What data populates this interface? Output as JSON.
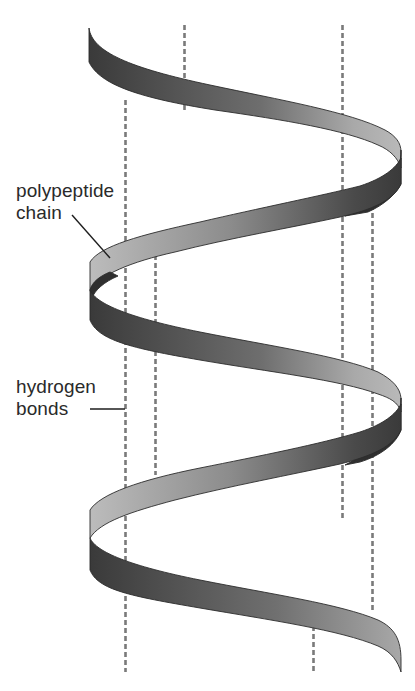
{
  "diagram": {
    "labels": {
      "polypeptide": {
        "line1": "polypeptide",
        "line2": "chain"
      },
      "hydrogen": {
        "line1": "hydrogen",
        "line2": "bonds"
      }
    },
    "colors": {
      "background": "#ffffff",
      "ribbon_dark": "#3a3a3a",
      "ribbon_mid": "#8a8a8a",
      "ribbon_light": "#bdbdbd",
      "dashed_line": "#7a7a7a",
      "text": "#2a2a2a"
    },
    "elements": {
      "ribbon_turns": 2,
      "hydrogen_bond_lines": 6
    }
  }
}
